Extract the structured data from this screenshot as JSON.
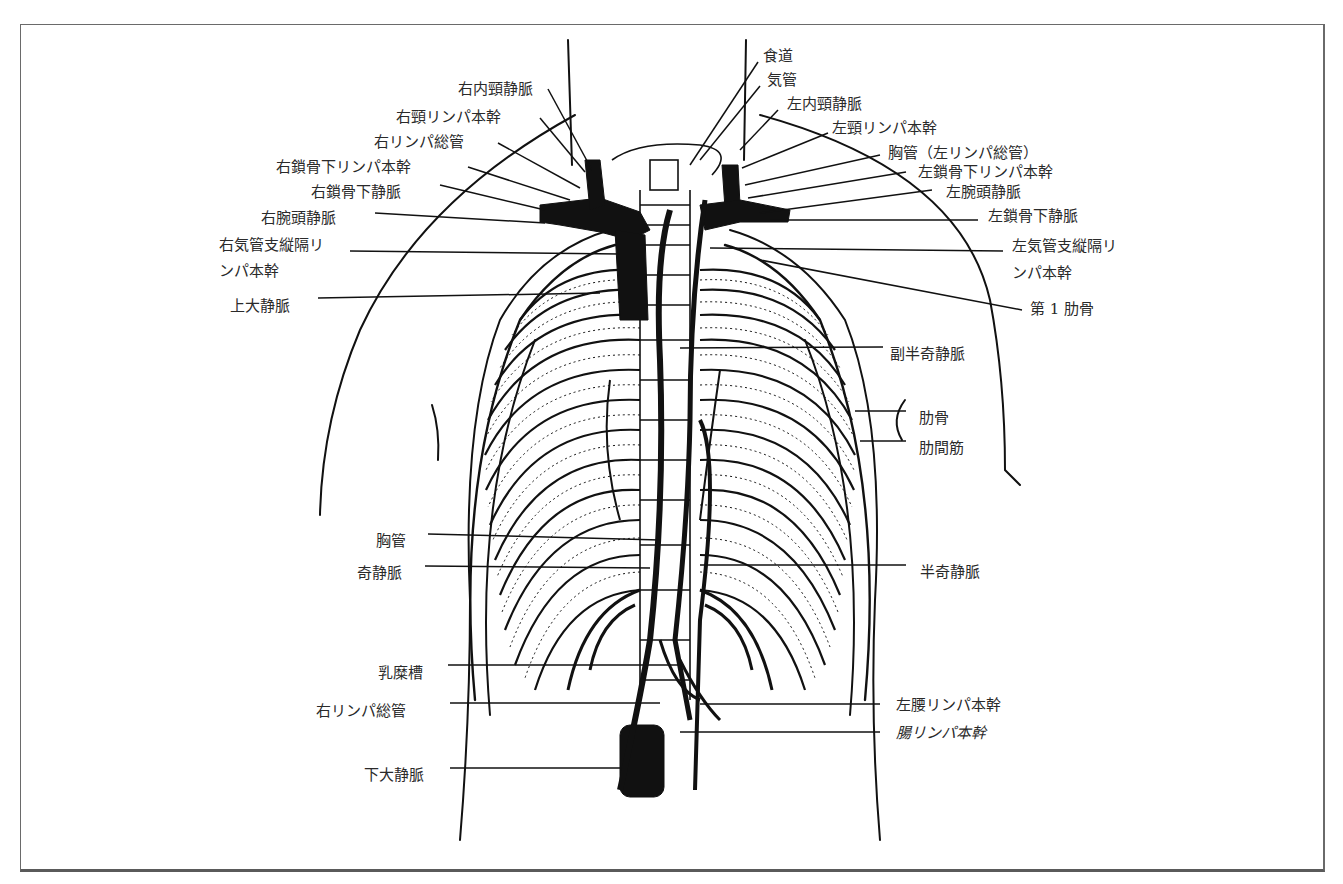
{
  "figure": {
    "colors": {
      "ink": "#111111",
      "label": "#2a2a2a",
      "frame": "#6a6a6a",
      "background": "#ffffff"
    }
  },
  "labels_left": [
    {
      "id": "r-int-jugular",
      "text": "右内頸静脈",
      "x": 458,
      "y": 80,
      "lx1": 548,
      "ly1": 89,
      "lx2": 592,
      "ly2": 170
    },
    {
      "id": "r-jugular-trunk",
      "text": "右頸リンパ本幹",
      "x": 396,
      "y": 108,
      "lx1": 540,
      "ly1": 118,
      "lx2": 585,
      "ly2": 172
    },
    {
      "id": "r-lymph-duct",
      "text": "右リンパ総管",
      "x": 374,
      "y": 133,
      "lx1": 498,
      "ly1": 143,
      "lx2": 580,
      "ly2": 188
    },
    {
      "id": "r-subclavian-trunk",
      "text": "右鎖骨下リンパ本幹",
      "x": 276,
      "y": 158,
      "lx1": 468,
      "ly1": 167,
      "lx2": 570,
      "ly2": 200
    },
    {
      "id": "r-subclavian-vein",
      "text": "右鎖骨下静脈",
      "x": 311,
      "y": 183,
      "lx1": 440,
      "ly1": 185,
      "lx2": 545,
      "ly2": 210
    },
    {
      "id": "r-brachiocephalic",
      "text": "右腕頭静脈",
      "x": 261,
      "y": 209,
      "lx1": 375,
      "ly1": 213,
      "lx2": 545,
      "ly2": 223
    },
    {
      "id": "r-bronchomediastinal",
      "text": "右気管支縦隔リ",
      "x": 219,
      "y": 236,
      "lx1": 350,
      "ly1": 251,
      "lx2": 620,
      "ly2": 254
    },
    {
      "id": "r-bronchomediastinal-2",
      "text": "ンパ本幹",
      "x": 219,
      "y": 262
    },
    {
      "id": "svc",
      "text": "上大静脈",
      "x": 230,
      "y": 297,
      "lx1": 318,
      "ly1": 298,
      "lx2": 600,
      "ly2": 293
    },
    {
      "id": "thoracic-duct",
      "text": "胸管",
      "x": 376,
      "y": 532,
      "lx1": 428,
      "ly1": 534,
      "lx2": 660,
      "ly2": 540
    },
    {
      "id": "azygos",
      "text": "奇静脈",
      "x": 357,
      "y": 564,
      "lx1": 425,
      "ly1": 566,
      "lx2": 650,
      "ly2": 568
    },
    {
      "id": "cisterna-chyli",
      "text": "乳糜槽",
      "x": 378,
      "y": 664,
      "lx1": 448,
      "ly1": 665,
      "lx2": 680,
      "ly2": 665
    },
    {
      "id": "r-lymph-duct-lower",
      "text": "右リンパ総管",
      "x": 316,
      "y": 702,
      "lx1": 450,
      "ly1": 703,
      "lx2": 660,
      "ly2": 703
    },
    {
      "id": "ivc",
      "text": "下大静脈",
      "x": 364,
      "y": 766,
      "lx1": 450,
      "ly1": 768,
      "lx2": 620,
      "ly2": 768
    }
  ],
  "labels_right": [
    {
      "id": "esophagus",
      "text": "食道",
      "x": 763,
      "y": 47,
      "lx1": 758,
      "ly1": 62,
      "lx2": 690,
      "ly2": 165
    },
    {
      "id": "trachea",
      "text": "気管",
      "x": 767,
      "y": 71,
      "lx1": 760,
      "ly1": 86,
      "lx2": 700,
      "ly2": 160
    },
    {
      "id": "l-int-jugular",
      "text": "左内頸静脈",
      "x": 787,
      "y": 95,
      "lx1": 778,
      "ly1": 110,
      "lx2": 740,
      "ly2": 150
    },
    {
      "id": "l-jugular-trunk",
      "text": "左頸リンパ本幹",
      "x": 832,
      "y": 119,
      "lx1": 828,
      "ly1": 133,
      "lx2": 742,
      "ly2": 168
    },
    {
      "id": "thoracic-duct-upper",
      "text": "胸管（左リンパ総管）",
      "x": 888,
      "y": 144,
      "lx1": 880,
      "ly1": 155,
      "lx2": 745,
      "ly2": 185
    },
    {
      "id": "l-subclavian-trunk",
      "text": "左鎖骨下リンパ本幹",
      "x": 918,
      "y": 163,
      "lx1": 906,
      "ly1": 172,
      "lx2": 748,
      "ly2": 198
    },
    {
      "id": "l-brachiocephalic",
      "text": "左腕頭静脈",
      "x": 946,
      "y": 183,
      "lx1": 932,
      "ly1": 190,
      "lx2": 760,
      "ly2": 213
    },
    {
      "id": "l-subclavian-vein",
      "text": "左鎖骨下静脈",
      "x": 988,
      "y": 207,
      "lx1": 978,
      "ly1": 220,
      "lx2": 770,
      "ly2": 220
    },
    {
      "id": "l-bronchomediastinal",
      "text": "左気管支縦隔リ",
      "x": 1012,
      "y": 237,
      "lx1": 1003,
      "ly1": 251,
      "lx2": 710,
      "ly2": 248
    },
    {
      "id": "l-bronchomediastinal-2",
      "text": "ンパ本幹",
      "x": 1012,
      "y": 264
    },
    {
      "id": "first-rib",
      "text": "第 1 肋骨",
      "x": 1030,
      "y": 300,
      "lx1": 1022,
      "ly1": 310,
      "lx2": 760,
      "ly2": 260
    },
    {
      "id": "accessory-hemiazygos",
      "text": "副半奇静脈",
      "x": 890,
      "y": 345,
      "lx1": 883,
      "ly1": 347,
      "lx2": 680,
      "ly2": 348
    },
    {
      "id": "rib",
      "text": "肋骨",
      "x": 919,
      "y": 409,
      "lx1": 906,
      "ly1": 411,
      "lx2": 855,
      "ly2": 411
    },
    {
      "id": "intercostal",
      "text": "肋間筋",
      "x": 919,
      "y": 439,
      "lx1": 906,
      "ly1": 441,
      "lx2": 860,
      "ly2": 441
    },
    {
      "id": "hemiazygos",
      "text": "半奇静脈",
      "x": 920,
      "y": 563,
      "lx1": 906,
      "ly1": 565,
      "lx2": 700,
      "ly2": 565
    },
    {
      "id": "l-lumbar-trunk",
      "text": "左腰リンパ本幹",
      "x": 896,
      "y": 696,
      "lx1": 880,
      "ly1": 704,
      "lx2": 700,
      "ly2": 704
    },
    {
      "id": "intestinal-trunk",
      "text": "腸リンパ本幹",
      "x": 896,
      "y": 724,
      "lx1": 880,
      "ly1": 732,
      "lx2": 680,
      "ly2": 732,
      "italic": true
    }
  ]
}
